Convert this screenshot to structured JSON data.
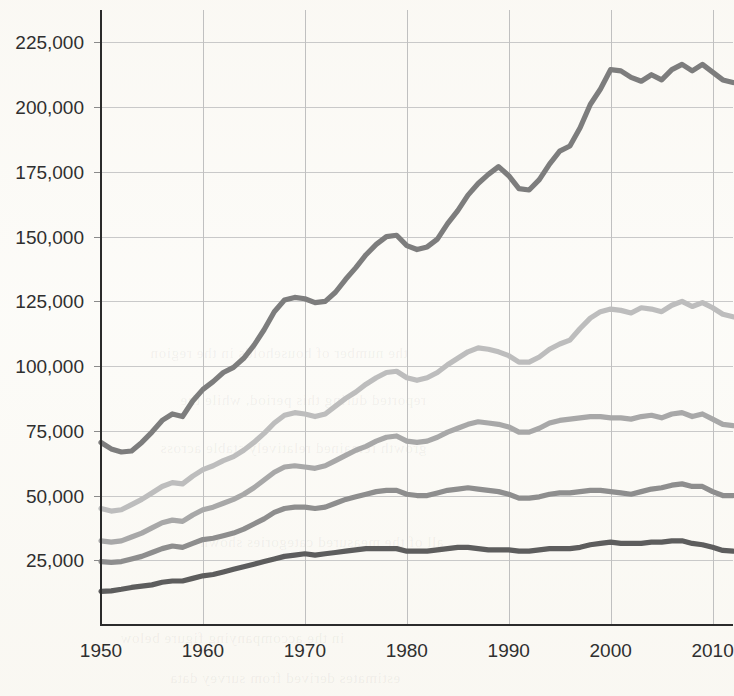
{
  "chart_data": {
    "type": "line",
    "title": "",
    "subtitle": "",
    "xlabel": "",
    "ylabel": "",
    "xlim": [
      1950,
      2012
    ],
    "ylim": [
      0,
      237500
    ],
    "grid": true,
    "legend_position": "none",
    "y_ticks": [
      25000,
      50000,
      75000,
      100000,
      125000,
      150000,
      175000,
      200000,
      225000
    ],
    "y_tick_labels": [
      "25,000",
      "50,000",
      "75,000",
      "100,000",
      "125,000",
      "150,000",
      "175,000",
      "200,000",
      "225,000"
    ],
    "x_ticks": [
      1950,
      1960,
      1970,
      1980,
      1990,
      2000,
      2010
    ],
    "x_tick_labels": [
      "1950",
      "1960",
      "1970",
      "1980",
      "1990",
      "2000",
      "2010"
    ],
    "x": [
      1950,
      1951,
      1952,
      1953,
      1954,
      1955,
      1956,
      1957,
      1958,
      1959,
      1960,
      1961,
      1962,
      1963,
      1964,
      1965,
      1966,
      1967,
      1968,
      1969,
      1970,
      1971,
      1972,
      1973,
      1974,
      1975,
      1976,
      1977,
      1978,
      1979,
      1980,
      1981,
      1982,
      1983,
      1984,
      1985,
      1986,
      1987,
      1988,
      1989,
      1990,
      1991,
      1992,
      1993,
      1994,
      1995,
      1996,
      1997,
      1998,
      1999,
      2000,
      2001,
      2002,
      2003,
      2004,
      2005,
      2006,
      2007,
      2008,
      2009,
      2010,
      2011,
      2012
    ],
    "series": [
      {
        "name": "series-1",
        "color": "#7d7d7d",
        "stroke_width": 5.2,
        "values": [
          70500,
          68000,
          66800,
          67200,
          70500,
          74500,
          79000,
          81500,
          80500,
          86500,
          91000,
          94000,
          97500,
          99500,
          103000,
          108000,
          114000,
          121000,
          125500,
          126500,
          126000,
          124500,
          125000,
          128500,
          133500,
          138000,
          143000,
          147000,
          150000,
          150500,
          146500,
          145000,
          146000,
          149000,
          155000,
          160000,
          166000,
          170500,
          174000,
          177000,
          173500,
          168500,
          168000,
          172000,
          178000,
          183000,
          185000,
          192000,
          201000,
          207000,
          214500,
          214000,
          211500,
          210000,
          212500,
          210500,
          214500,
          216500,
          214000,
          216500,
          213500,
          210500,
          209500
        ]
      },
      {
        "name": "series-2",
        "color": "#bdbdbd",
        "stroke_width": 5.2,
        "values": [
          45000,
          44000,
          44500,
          46500,
          48500,
          51000,
          53500,
          55000,
          54500,
          57500,
          60000,
          61500,
          63500,
          65000,
          67500,
          70500,
          74000,
          78000,
          81000,
          82000,
          81500,
          80500,
          81500,
          84500,
          87500,
          90000,
          93000,
          95500,
          97500,
          98000,
          95500,
          94500,
          95500,
          97500,
          100500,
          103000,
          105500,
          107000,
          106500,
          105500,
          104000,
          101500,
          101500,
          103500,
          106500,
          108500,
          110000,
          114500,
          118500,
          121000,
          122000,
          121500,
          120500,
          122500,
          122000,
          121000,
          123500,
          125000,
          123000,
          124500,
          122500,
          120000,
          119000
        ]
      },
      {
        "name": "series-3",
        "color": "#a8a8a8",
        "stroke_width": 5.2,
        "values": [
          32500,
          32000,
          32500,
          34000,
          35500,
          37500,
          39500,
          40500,
          40000,
          42500,
          44500,
          45500,
          47000,
          48500,
          50500,
          53000,
          56000,
          59000,
          61000,
          61500,
          61000,
          60500,
          61500,
          63500,
          65500,
          67500,
          69000,
          71000,
          72500,
          73000,
          71000,
          70500,
          71000,
          72500,
          74500,
          76000,
          77500,
          78500,
          78000,
          77500,
          76500,
          74500,
          74500,
          76000,
          78000,
          79000,
          79500,
          80000,
          80500,
          80500,
          80000,
          80000,
          79500,
          80500,
          81000,
          80000,
          81500,
          82000,
          80500,
          81500,
          79500,
          77500,
          77000
        ]
      },
      {
        "name": "series-4",
        "color": "#8e8e8e",
        "stroke_width": 5.2,
        "values": [
          24500,
          24200,
          24500,
          25500,
          26500,
          28000,
          29500,
          30500,
          30000,
          31500,
          33000,
          33500,
          34500,
          35500,
          37000,
          39000,
          41000,
          43500,
          45000,
          45500,
          45500,
          45000,
          45500,
          47000,
          48500,
          49500,
          50500,
          51500,
          52000,
          52000,
          50500,
          50000,
          50000,
          51000,
          52000,
          52500,
          53000,
          52500,
          52000,
          51500,
          50500,
          49000,
          49000,
          49500,
          50500,
          51000,
          51000,
          51500,
          52000,
          52000,
          51500,
          51000,
          50500,
          51500,
          52500,
          53000,
          54000,
          54500,
          53500,
          53500,
          51500,
          50000,
          50000
        ]
      },
      {
        "name": "series-5",
        "color": "#5d5d5d",
        "stroke_width": 5.2,
        "values": [
          13000,
          13200,
          13800,
          14500,
          15000,
          15500,
          16500,
          17000,
          17000,
          18000,
          19000,
          19500,
          20500,
          21500,
          22500,
          23500,
          24500,
          25500,
          26500,
          27000,
          27500,
          27000,
          27500,
          28000,
          28500,
          29000,
          29500,
          29500,
          29500,
          29500,
          28500,
          28500,
          28500,
          29000,
          29500,
          30000,
          30000,
          29500,
          29000,
          29000,
          29000,
          28500,
          28500,
          29000,
          29500,
          29500,
          29500,
          30000,
          31000,
          31500,
          32000,
          31500,
          31500,
          31500,
          32000,
          32000,
          32500,
          32500,
          31500,
          31000,
          30000,
          28800,
          28500
        ]
      }
    ]
  },
  "bleed_text": {
    "lines": [
      "the number of households in the region",
      "reported during this period, while the",
      "growth remained relatively stable across",
      "all of the measured categories shown",
      "in the accompanying figure below",
      "estimates derived from survey data"
    ]
  }
}
